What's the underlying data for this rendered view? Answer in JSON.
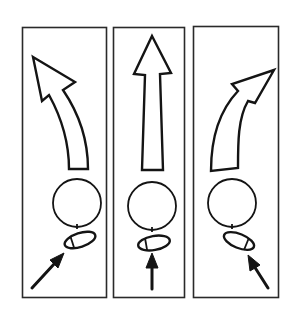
{
  "figure": {
    "description": "Three-panel line drawing: ball trajectory depending on foot contact direction",
    "colors": {
      "ink": "#141414",
      "background": "#ffffff",
      "frame": "#2a2a2a"
    },
    "panels": [
      {
        "id": "left",
        "trajectory": "curve-left",
        "kick_direction": "diagonal-up-right",
        "foot_tilt": "toward-upper-right"
      },
      {
        "id": "center",
        "trajectory": "straight-up",
        "kick_direction": "straight-up",
        "foot_tilt": "slightly-up"
      },
      {
        "id": "right",
        "trajectory": "curve-right",
        "kick_direction": "diagonal-up-left",
        "foot_tilt": "toward-lower-right"
      }
    ]
  }
}
